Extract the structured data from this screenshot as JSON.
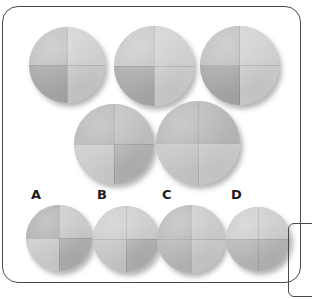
{
  "puzzle": {
    "type": "visual-analogy-quadrant-shading",
    "frame": {
      "border_color": "#4a4a4a",
      "background_color": "#ffffff",
      "x": 2,
      "y": 6,
      "width": 299,
      "height": 277,
      "corner_radius": 16
    },
    "partial_frame": {
      "x": 288,
      "y": 223,
      "width": 40,
      "height": 74,
      "corner_radius": 6,
      "border_color": "#4a4a4a"
    },
    "palette": {
      "light": "#cfcfcf",
      "mid": "#bdbdbd",
      "dark": "#a9a9a9",
      "darker": "#9b9b9b",
      "shadow": "rgba(90,90,90,0.45)",
      "seam": "rgba(120,120,120,0.30)"
    },
    "stimulus_rows": [
      {
        "row_name": "top-row",
        "circles": [
          {
            "name": "stimulus-circle-1",
            "x": 29,
            "y": 27,
            "size": 76,
            "quadrants": {
              "top_left": "#bdbdbd",
              "top_right": "#d2d2d2",
              "bottom_left": "#a6a6a6",
              "bottom_right": "#cccccc"
            }
          },
          {
            "name": "stimulus-circle-2",
            "x": 114,
            "y": 26,
            "size": 80,
            "quadrants": {
              "top_left": "#c4c4c4",
              "top_right": "#d2d2d2",
              "bottom_left": "#a9a9a9",
              "bottom_right": "#d0d0d0"
            }
          },
          {
            "name": "stimulus-circle-3",
            "x": 200,
            "y": 26,
            "size": 79,
            "quadrants": {
              "top_left": "#bcbcbc",
              "top_right": "#d2d2d2",
              "bottom_left": "#a6a6a6",
              "bottom_right": "#cfcfcf"
            }
          }
        ]
      },
      {
        "row_name": "middle-row",
        "circles": [
          {
            "name": "stimulus-circle-4",
            "x": 74,
            "y": 104,
            "size": 80,
            "quadrants": {
              "top_left": "#b4b4b4",
              "top_right": "#bfbfbf",
              "bottom_left": "#cccccc",
              "bottom_right": "#b6b6b6"
            }
          },
          {
            "name": "stimulus-circle-5",
            "x": 156,
            "y": 101,
            "size": 84,
            "quadrants": {
              "top_left": "#b4b4b4",
              "top_right": "#b6b6b6",
              "bottom_left": "#c6c6c6",
              "bottom_right": "#cfcfcf"
            }
          }
        ]
      }
    ],
    "options": [
      {
        "letter": "A",
        "name": "option-a",
        "label_x": 31,
        "label_y": 188,
        "x": 26,
        "y": 205,
        "size": 66,
        "quadrants": {
          "top_left": "#adadad",
          "top_right": "#c9c9c9",
          "bottom_left": "#cbcbcb",
          "bottom_right": "#b2b2b2"
        }
      },
      {
        "letter": "B",
        "name": "option-b",
        "label_x": 97,
        "label_y": 188,
        "x": 93,
        "y": 206,
        "size": 66,
        "quadrants": {
          "top_left": "#cacaca",
          "top_right": "#cdcdcd",
          "bottom_left": "#c6c6c6",
          "bottom_right": "#b4b4b4"
        }
      },
      {
        "letter": "C",
        "name": "option-c",
        "label_x": 162,
        "label_y": 188,
        "x": 157,
        "y": 205,
        "size": 68,
        "quadrants": {
          "top_left": "#b6b6b6",
          "top_right": "#cbcbcb",
          "bottom_left": "#b6b6b6",
          "bottom_right": "#cdcdcd"
        }
      },
      {
        "letter": "D",
        "name": "option-d",
        "label_x": 231,
        "label_y": 188,
        "x": 226,
        "y": 207,
        "size": 64,
        "quadrants": {
          "top_left": "#cbcbcb",
          "top_right": "#cdcdcd",
          "bottom_left": "#b6b6b6",
          "bottom_right": "#b8b8b8"
        }
      }
    ]
  }
}
